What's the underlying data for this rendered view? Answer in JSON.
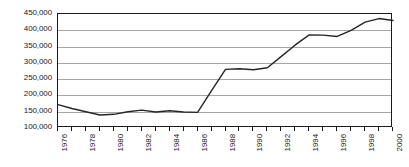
{
  "chart_data": {
    "type": "line",
    "title": "",
    "subtitle": "",
    "xlabel": "",
    "ylabel": "",
    "grid": "horizontal",
    "legend": "none",
    "xlim": [
      1976,
      2000
    ],
    "ylim": [
      100000,
      450000
    ],
    "ytick_step": 50000,
    "ytick_labels": [
      "450,000",
      "400,000",
      "350,000",
      "300,000",
      "250,000",
      "200,000",
      "150,000",
      "100,000"
    ],
    "ytick_values": [
      450000,
      400000,
      350000,
      300000,
      250000,
      200000,
      150000,
      100000
    ],
    "xtick_labels": [
      "1976",
      "1978",
      "1980",
      "1982",
      "1984",
      "1986",
      "1988",
      "1990",
      "1992",
      "1994",
      "1996",
      "1998",
      "2000"
    ],
    "xtick_values": [
      1976,
      1978,
      1980,
      1982,
      1984,
      1986,
      1988,
      1990,
      1992,
      1994,
      1996,
      1998,
      2000
    ],
    "x": [
      1976,
      1977,
      1978,
      1979,
      1980,
      1981,
      1982,
      1983,
      1984,
      1985,
      1986,
      1987,
      1988,
      1989,
      1990,
      1991,
      1992,
      1993,
      1994,
      1995,
      1996,
      1997,
      1998,
      1999,
      2000
    ],
    "values": [
      172000,
      160000,
      150000,
      140000,
      142000,
      150000,
      155000,
      149000,
      153000,
      149000,
      148000,
      215000,
      280000,
      282000,
      279000,
      285000,
      320000,
      355000,
      386000,
      385000,
      381000,
      400000,
      425000,
      436000,
      430000
    ],
    "series": [
      {
        "name": "series-1",
        "color": "#262626",
        "values": [
          172000,
          160000,
          150000,
          140000,
          142000,
          150000,
          155000,
          149000,
          153000,
          149000,
          148000,
          215000,
          280000,
          282000,
          279000,
          285000,
          320000,
          355000,
          386000,
          385000,
          381000,
          400000,
          425000,
          436000,
          430000
        ]
      }
    ]
  },
  "style": {
    "line_color": "#262626",
    "gridline_color": "#a6a6a6",
    "axis_color": "#1a1a1a",
    "background": "#ffffff"
  }
}
